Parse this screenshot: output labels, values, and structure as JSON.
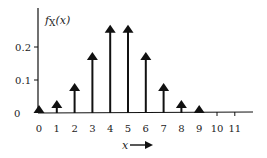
{
  "chart_data": {
    "type": "bar",
    "style": "impulse-arrows",
    "title": "",
    "xlabel": "x",
    "ylabel": "fX(x)",
    "ylabel_parts": {
      "f": "f",
      "sub": "X",
      "arg": "(x)"
    },
    "categories": [
      "0",
      "1",
      "2",
      "3",
      "4",
      "5",
      "6",
      "7",
      "8",
      "9",
      "10",
      "11"
    ],
    "x": [
      0,
      1,
      2,
      3,
      4,
      5,
      6,
      7,
      8,
      9,
      10,
      11
    ],
    "values": [
      0.002,
      0.018,
      0.07,
      0.164,
      0.246,
      0.246,
      0.164,
      0.07,
      0.018,
      0.002,
      0,
      0
    ],
    "stems_drawn_for": [
      0,
      1,
      2,
      3,
      4,
      5,
      6,
      7,
      8,
      9
    ],
    "y_ticks": [
      {
        "value": 0.2,
        "label": "0.2"
      },
      {
        "value": 0.1,
        "label": "0.1"
      },
      {
        "value": 0,
        "label": "0"
      }
    ],
    "ylim": [
      0,
      0.3
    ],
    "xlim": [
      0,
      11.9
    ],
    "grid": false,
    "legend": null,
    "colors": {
      "ink": "#111111",
      "background": "#ffffff"
    }
  }
}
